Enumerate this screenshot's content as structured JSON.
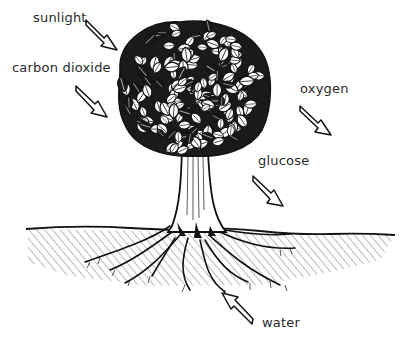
{
  "diagram": {
    "labels": [
      {
        "id": "sunlight",
        "text": "sunlight",
        "x": 33,
        "y": 11,
        "direction": "in"
      },
      {
        "id": "carbon-dioxide",
        "text": "carbon dioxide",
        "x": 12,
        "y": 61,
        "direction": "in"
      },
      {
        "id": "oxygen",
        "text": "oxygen",
        "x": 300,
        "y": 82,
        "direction": "out"
      },
      {
        "id": "glucose",
        "text": "glucose",
        "x": 258,
        "y": 156,
        "direction": "out"
      },
      {
        "id": "water",
        "text": "water",
        "x": 262,
        "y": 316,
        "direction": "in"
      }
    ],
    "colors": {
      "ink": "#111111",
      "text": "#2a2a2a",
      "background": "#ffffff"
    }
  }
}
